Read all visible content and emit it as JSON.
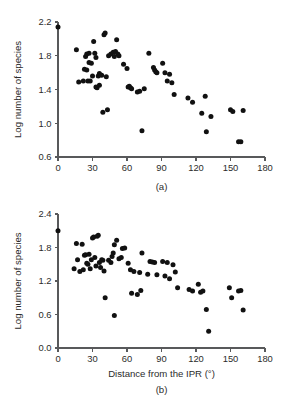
{
  "figure": {
    "shared_xlabel": "Distance from the IPR (°)",
    "shared_ylabel": "Log number of species"
  },
  "chart_data": [
    {
      "type": "scatter",
      "panel": "a",
      "caption": "(a)",
      "title": "",
      "xlabel": "",
      "ylabel": "Log number of species",
      "xlim": [
        0,
        180
      ],
      "ylim": [
        0.6,
        2.2
      ],
      "xticks": [
        0,
        30,
        60,
        90,
        120,
        150,
        180
      ],
      "yticks": [
        0.6,
        1.0,
        1.4,
        1.8,
        2.2
      ],
      "xtick_labels": [
        "0",
        "30",
        "60",
        "90",
        "120",
        "150",
        "180"
      ],
      "ytick_labels": [
        "0.6",
        "1.0",
        "1.4",
        "1.8",
        "2.2"
      ],
      "grid": false,
      "legend": null,
      "marker": "filled-circle",
      "marker_color": "#111111",
      "points": [
        [
          0,
          2.14
        ],
        [
          16,
          1.87
        ],
        [
          18,
          1.49
        ],
        [
          22,
          1.5
        ],
        [
          23,
          1.64
        ],
        [
          24,
          1.79
        ],
        [
          25,
          1.82
        ],
        [
          25,
          1.63
        ],
        [
          26,
          1.5
        ],
        [
          27,
          1.83
        ],
        [
          27,
          1.72
        ],
        [
          28,
          1.5
        ],
        [
          29,
          1.71
        ],
        [
          30,
          1.56
        ],
        [
          31,
          1.97
        ],
        [
          32,
          1.83
        ],
        [
          33,
          1.78
        ],
        [
          33,
          1.43
        ],
        [
          34,
          1.42
        ],
        [
          35,
          1.56
        ],
        [
          36,
          1.59
        ],
        [
          36,
          1.45
        ],
        [
          38,
          1.57
        ],
        [
          39,
          1.13
        ],
        [
          40,
          2.05
        ],
        [
          41,
          2.07
        ],
        [
          42,
          1.55
        ],
        [
          43,
          1.16
        ],
        [
          44,
          1.8
        ],
        [
          46,
          1.82
        ],
        [
          48,
          1.84
        ],
        [
          49,
          1.79
        ],
        [
          50,
          1.85
        ],
        [
          51,
          1.99
        ],
        [
          52,
          1.82
        ],
        [
          53,
          1.8
        ],
        [
          57,
          1.7
        ],
        [
          60,
          1.65
        ],
        [
          61,
          1.43
        ],
        [
          62,
          1.44
        ],
        [
          63,
          1.42
        ],
        [
          64,
          1.41
        ],
        [
          69,
          1.37
        ],
        [
          71,
          1.38
        ],
        [
          73,
          0.91
        ],
        [
          75,
          1.41
        ],
        [
          79,
          1.83
        ],
        [
          83,
          1.66
        ],
        [
          84,
          1.63
        ],
        [
          85,
          1.61
        ],
        [
          86,
          1.6
        ],
        [
          91,
          1.71
        ],
        [
          93,
          1.6
        ],
        [
          95,
          1.5
        ],
        [
          97,
          1.58
        ],
        [
          99,
          1.48
        ],
        [
          101,
          1.34
        ],
        [
          113,
          1.3
        ],
        [
          117,
          1.25
        ],
        [
          125,
          1.12
        ],
        [
          128,
          1.32
        ],
        [
          129,
          0.9
        ],
        [
          133,
          1.08
        ],
        [
          150,
          1.16
        ],
        [
          152,
          1.14
        ],
        [
          157,
          0.78
        ],
        [
          159,
          0.78
        ],
        [
          161,
          1.15
        ]
      ]
    },
    {
      "type": "scatter",
      "panel": "b",
      "caption": "(b)",
      "title": "",
      "xlabel": "Distance from the IPR (°)",
      "ylabel": "Log number of species",
      "xlim": [
        0,
        180
      ],
      "ylim": [
        0.0,
        2.4
      ],
      "xticks": [
        0,
        30,
        60,
        90,
        120,
        150,
        180
      ],
      "yticks": [
        0.0,
        0.6,
        1.2,
        1.8,
        2.4
      ],
      "xtick_labels": [
        "0",
        "30",
        "60",
        "90",
        "120",
        "150",
        "180"
      ],
      "ytick_labels": [
        "0.0",
        "0.6",
        "1.2",
        "1.8",
        "2.4"
      ],
      "grid": false,
      "legend": null,
      "marker": "filled-circle",
      "marker_color": "#111111",
      "points": [
        [
          0,
          2.1
        ],
        [
          14,
          1.42
        ],
        [
          16,
          1.87
        ],
        [
          17,
          1.58
        ],
        [
          19,
          1.37
        ],
        [
          21,
          1.86
        ],
        [
          22,
          1.4
        ],
        [
          23,
          1.66
        ],
        [
          24,
          1.67
        ],
        [
          25,
          1.52
        ],
        [
          26,
          1.5
        ],
        [
          27,
          1.68
        ],
        [
          28,
          1.42
        ],
        [
          29,
          1.58
        ],
        [
          30,
          1.97
        ],
        [
          31,
          1.99
        ],
        [
          32,
          1.62
        ],
        [
          33,
          1.47
        ],
        [
          34,
          2.0
        ],
        [
          35,
          2.02
        ],
        [
          36,
          1.53
        ],
        [
          37,
          1.44
        ],
        [
          38,
          1.58
        ],
        [
          39,
          1.57
        ],
        [
          40,
          1.38
        ],
        [
          41,
          0.9
        ],
        [
          44,
          1.57
        ],
        [
          46,
          1.53
        ],
        [
          47,
          1.64
        ],
        [
          48,
          1.7
        ],
        [
          49,
          1.85
        ],
        [
          49,
          0.58
        ],
        [
          51,
          1.93
        ],
        [
          53,
          1.6
        ],
        [
          55,
          1.62
        ],
        [
          56,
          1.78
        ],
        [
          58,
          1.79
        ],
        [
          61,
          1.52
        ],
        [
          63,
          1.4
        ],
        [
          64,
          0.98
        ],
        [
          66,
          1.37
        ],
        [
          69,
          0.96
        ],
        [
          71,
          1.35
        ],
        [
          72,
          1.03
        ],
        [
          73,
          1.7
        ],
        [
          78,
          1.32
        ],
        [
          80,
          1.55
        ],
        [
          82,
          1.54
        ],
        [
          84,
          1.53
        ],
        [
          86,
          1.31
        ],
        [
          91,
          1.55
        ],
        [
          93,
          1.29
        ],
        [
          95,
          1.53
        ],
        [
          97,
          1.24
        ],
        [
          100,
          1.49
        ],
        [
          102,
          1.36
        ],
        [
          104,
          1.08
        ],
        [
          114,
          1.05
        ],
        [
          117,
          1.02
        ],
        [
          122,
          1.14
        ],
        [
          124,
          1.0
        ],
        [
          126,
          1.02
        ],
        [
          129,
          0.69
        ],
        [
          131,
          0.3
        ],
        [
          149,
          1.08
        ],
        [
          151,
          0.9
        ],
        [
          157,
          1.02
        ],
        [
          159,
          1.03
        ],
        [
          161,
          0.68
        ]
      ]
    }
  ]
}
